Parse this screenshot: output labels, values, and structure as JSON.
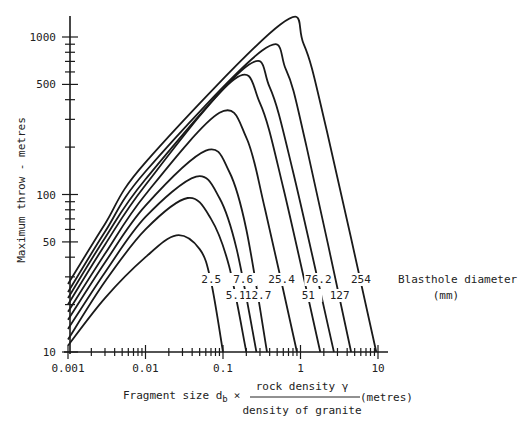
{
  "chart_data": {
    "type": "line",
    "title": "",
    "xlabel": "Fragment size d_b × (rock density γ / density of granite) (metres)",
    "xlabel_parts": {
      "prefix": "Fragment size d",
      "subscript": "b",
      "times": "×",
      "numerator": "rock density γ",
      "denominator": "density of granite",
      "unit": "(metres)"
    },
    "ylabel": "Maximum throw  - metres",
    "xscale": "log",
    "yscale": "log",
    "xlim": [
      0.001,
      10
    ],
    "ylim": [
      10,
      1300
    ],
    "x_ticks": [
      {
        "value": 0.001,
        "label": "0.001"
      },
      {
        "value": 0.01,
        "label": "0.01"
      },
      {
        "value": 0.1,
        "label": "0.1"
      },
      {
        "value": 1,
        "label": "1"
      },
      {
        "value": 10,
        "label": "10"
      }
    ],
    "y_ticks": [
      {
        "value": 10,
        "label": "10"
      },
      {
        "value": 50,
        "label": "50"
      },
      {
        "value": 100,
        "label": "100"
      },
      {
        "value": 500,
        "label": "500"
      },
      {
        "value": 1000,
        "label": "1000"
      }
    ],
    "legend_title": "Blasthole diameter",
    "legend_unit": "(mm)",
    "grid": false,
    "series": [
      {
        "name": "2.5",
        "label_row": 1,
        "points": [
          [
            0.001,
            11
          ],
          [
            0.003,
            22
          ],
          [
            0.01,
            40
          ],
          [
            0.025,
            55
          ],
          [
            0.05,
            45
          ],
          [
            0.07,
            28
          ],
          [
            0.1,
            10
          ]
        ]
      },
      {
        "name": "5.1",
        "label_row": 2,
        "points": [
          [
            0.001,
            12
          ],
          [
            0.003,
            28
          ],
          [
            0.01,
            60
          ],
          [
            0.035,
            95
          ],
          [
            0.07,
            70
          ],
          [
            0.12,
            35
          ],
          [
            0.2,
            10
          ]
        ]
      },
      {
        "name": "7.6",
        "label_row": 1,
        "points": [
          [
            0.001,
            14
          ],
          [
            0.003,
            32
          ],
          [
            0.01,
            72
          ],
          [
            0.045,
            130
          ],
          [
            0.09,
            95
          ],
          [
            0.15,
            45
          ],
          [
            0.27,
            10
          ]
        ]
      },
      {
        "name": "12.7",
        "label_row": 2,
        "points": [
          [
            0.001,
            16
          ],
          [
            0.003,
            37
          ],
          [
            0.01,
            85
          ],
          [
            0.06,
            190
          ],
          [
            0.12,
            140
          ],
          [
            0.2,
            60
          ],
          [
            0.37,
            10
          ]
        ]
      },
      {
        "name": "25.4",
        "label_row": 1,
        "points": [
          [
            0.001,
            18
          ],
          [
            0.003,
            42
          ],
          [
            0.01,
            100
          ],
          [
            0.09,
            330
          ],
          [
            0.2,
            230
          ],
          [
            0.35,
            80
          ],
          [
            0.9,
            10
          ]
        ]
      },
      {
        "name": "51",
        "label_row": 2,
        "points": [
          [
            0.001,
            20
          ],
          [
            0.003,
            48
          ],
          [
            0.01,
            115
          ],
          [
            0.14,
            540
          ],
          [
            0.3,
            380
          ],
          [
            0.6,
            110
          ],
          [
            1.8,
            10
          ]
        ]
      },
      {
        "name": "76.2",
        "label_row": 1,
        "points": [
          [
            0.001,
            22
          ],
          [
            0.003,
            53
          ],
          [
            0.01,
            125
          ],
          [
            0.2,
            650
          ],
          [
            0.4,
            480
          ],
          [
            0.8,
            140
          ],
          [
            2.7,
            10
          ]
        ]
      },
      {
        "name": "127",
        "label_row": 2,
        "points": [
          [
            0.001,
            24
          ],
          [
            0.003,
            58
          ],
          [
            0.01,
            140
          ],
          [
            0.32,
            820
          ],
          [
            0.65,
            620
          ],
          [
            1.2,
            200
          ],
          [
            4.5,
            10
          ]
        ]
      },
      {
        "name": "254",
        "label_row": 1,
        "points": [
          [
            0.001,
            27
          ],
          [
            0.003,
            65
          ],
          [
            0.01,
            160
          ],
          [
            0.55,
            1200
          ],
          [
            1.1,
            900
          ],
          [
            2.2,
            250
          ],
          [
            9.5,
            10
          ]
        ]
      }
    ]
  }
}
